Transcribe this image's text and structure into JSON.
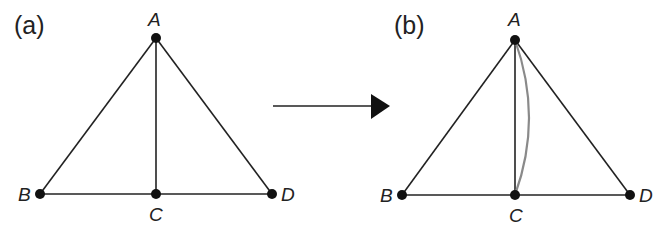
{
  "diagram": {
    "panels": [
      {
        "label": "(a)",
        "vertices": {
          "A": "A",
          "B": "B",
          "C": "C",
          "D": "D"
        },
        "edges": [
          "A-B",
          "A-C",
          "A-D",
          "B-C",
          "C-D"
        ]
      },
      {
        "label": "(b)",
        "vertices": {
          "A": "A",
          "B": "B",
          "C": "C",
          "D": "D"
        },
        "edges": [
          "A-B",
          "A-C",
          "A-D",
          "B-C",
          "C-D"
        ],
        "extra_edges": [
          "A-C (curved, gray)"
        ]
      }
    ],
    "arrow": "right-arrow",
    "colors": {
      "line": "#222222",
      "curve": "#8a8a8a",
      "node": "#111111"
    }
  }
}
